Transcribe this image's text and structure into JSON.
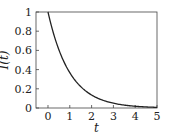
{
  "chart_data": {
    "type": "line",
    "title": "",
    "xlabel": "t",
    "ylabel": "I(t)",
    "xlim": [
      -0.55,
      5
    ],
    "ylim": [
      0,
      1
    ],
    "xticks": [
      0,
      1,
      2,
      3,
      4,
      5
    ],
    "yticks": [
      0,
      0.2,
      0.4,
      0.6,
      0.8,
      1
    ],
    "xtick_labels": [
      "0",
      "1",
      "2",
      "3",
      "4",
      "5"
    ],
    "ytick_labels": [
      "0",
      "0.2",
      "0.4",
      "0.6",
      "0.8",
      "1"
    ],
    "grid": false,
    "legend": null,
    "series": [
      {
        "name": "I(t) = exp(-t)",
        "color": "#222222",
        "x": [
          0,
          0.25,
          0.5,
          0.75,
          1,
          1.5,
          2,
          2.5,
          3,
          3.5,
          4,
          4.5,
          5
        ],
        "y": [
          1.0,
          0.78,
          0.61,
          0.47,
          0.37,
          0.22,
          0.14,
          0.08,
          0.05,
          0.03,
          0.02,
          0.01,
          0.007
        ]
      }
    ]
  }
}
